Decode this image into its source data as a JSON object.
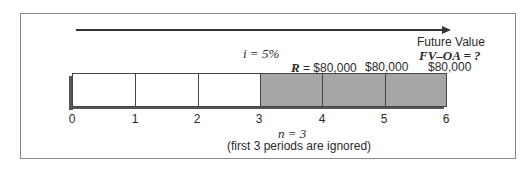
{
  "diagram": {
    "interest_label": "i = 5%",
    "payment_first": "R = $80,000",
    "payments": [
      "$80,000",
      "$80,000"
    ],
    "future_value_title": "Future Value",
    "future_value_formula": "FV–OA = ?",
    "periods_label": "n = 3",
    "note": "(first 3 periods are ignored)",
    "ticks": [
      "0",
      "1",
      "2",
      "3",
      "4",
      "5",
      "6"
    ],
    "colors": {
      "unshaded": "#ffffff",
      "shaded": "#a6a6a6",
      "border": "#444444",
      "shadow": "#555555"
    },
    "cells": [
      {
        "period": 1,
        "shaded": false
      },
      {
        "period": 2,
        "shaded": false
      },
      {
        "period": 3,
        "shaded": false
      },
      {
        "period": 4,
        "shaded": true
      },
      {
        "period": 5,
        "shaded": true
      },
      {
        "period": 6,
        "shaded": true
      }
    ]
  }
}
